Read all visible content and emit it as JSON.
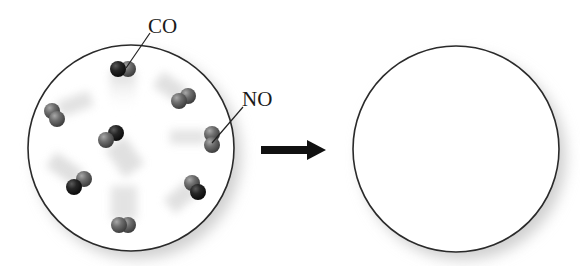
{
  "diagram": {
    "type": "reaction-schematic",
    "labels": {
      "co": "CO",
      "no": "NO"
    },
    "colors": {
      "carbon_dark": "#1f1f1f",
      "atom_grey": "#6f6f6f",
      "outline": "#2a2a2a",
      "arrow": "#111111",
      "background": "#ffffff"
    },
    "containers": [
      {
        "id": "before",
        "cx": 131,
        "cy": 148,
        "r": 103,
        "state": "reactants"
      },
      {
        "id": "after",
        "cx": 456,
        "cy": 149,
        "r": 103,
        "state": "empty"
      }
    ],
    "arrow": {
      "x1": 261,
      "y1": 150,
      "x2": 326,
      "y2": 150,
      "direction": "right"
    },
    "molecules": [
      {
        "formula": "CO",
        "atoms": [
          {
            "element": "C",
            "x": 118,
            "y": 69
          },
          {
            "element": "O",
            "x": 128,
            "y": 69
          }
        ],
        "labeled": true
      },
      {
        "formula": "NO",
        "atoms": [
          {
            "element": "N",
            "x": 179,
            "y": 101
          },
          {
            "element": "O",
            "x": 188,
            "y": 96
          }
        ],
        "labeled": false
      },
      {
        "formula": "NO",
        "atoms": [
          {
            "element": "N",
            "x": 52,
            "y": 111
          },
          {
            "element": "O",
            "x": 57,
            "y": 119
          }
        ],
        "labeled": false
      },
      {
        "formula": "CO",
        "atoms": [
          {
            "element": "C",
            "x": 116,
            "y": 133
          },
          {
            "element": "O",
            "x": 106,
            "y": 140
          }
        ],
        "labeled": false
      },
      {
        "formula": "NO",
        "atoms": [
          {
            "element": "N",
            "x": 212,
            "y": 134
          },
          {
            "element": "O",
            "x": 212,
            "y": 145
          }
        ],
        "labeled": true
      },
      {
        "formula": "CO",
        "atoms": [
          {
            "element": "C",
            "x": 74,
            "y": 187
          },
          {
            "element": "O",
            "x": 84,
            "y": 179
          }
        ],
        "labeled": false
      },
      {
        "formula": "CO",
        "atoms": [
          {
            "element": "C",
            "x": 198,
            "y": 192
          },
          {
            "element": "O",
            "x": 192,
            "y": 183
          }
        ],
        "labeled": false
      },
      {
        "formula": "NO",
        "atoms": [
          {
            "element": "N",
            "x": 119,
            "y": 225
          },
          {
            "element": "O",
            "x": 128,
            "y": 225
          }
        ],
        "labeled": false
      }
    ],
    "counts": {
      "CO": 4,
      "NO": 4
    }
  }
}
